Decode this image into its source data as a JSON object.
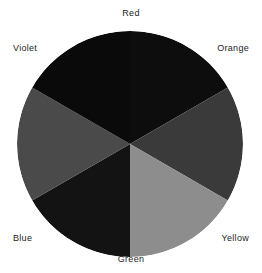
{
  "figure": {
    "background_color": "#ffffff",
    "label_color": "#1d1d1d"
  },
  "wheel": {
    "center_x": 130,
    "center_y": 144,
    "radius": 113,
    "segment_count": 6,
    "segment_angle_degrees": 60,
    "rendering": "grayscale"
  },
  "labels": {
    "red": "Red",
    "orange": "Orange",
    "yellow": "Yellow",
    "green": "Green",
    "blue": "Blue",
    "violet": "Violet"
  },
  "chart_data": {
    "type": "pie",
    "categories": [
      "Red",
      "Orange",
      "Yellow",
      "Green",
      "Blue",
      "Violet"
    ],
    "values": [
      60,
      60,
      60,
      60,
      60,
      60
    ],
    "unit": "degrees",
    "legend_position": "around-perimeter",
    "grid": false,
    "segments": [
      {
        "label": "Red",
        "start_angle": -90,
        "end_angle": -30,
        "fill": "#0d0d0d",
        "position": "top"
      },
      {
        "label": "Orange",
        "start_angle": -30,
        "end_angle": 30,
        "fill": "#3a3a3a",
        "position": "upper-right"
      },
      {
        "label": "Yellow",
        "start_angle": 30,
        "end_angle": 90,
        "fill": "#8d8d8d",
        "position": "lower-right"
      },
      {
        "label": "Green",
        "start_angle": 90,
        "end_angle": 150,
        "fill": "#131313",
        "position": "bottom"
      },
      {
        "label": "Blue",
        "start_angle": 150,
        "end_angle": 210,
        "fill": "#4a4a4a",
        "position": "lower-left"
      },
      {
        "label": "Violet",
        "start_angle": 210,
        "end_angle": 270,
        "fill": "#0a0a0a",
        "position": "upper-left"
      }
    ],
    "xlabel": "",
    "ylabel": ""
  }
}
